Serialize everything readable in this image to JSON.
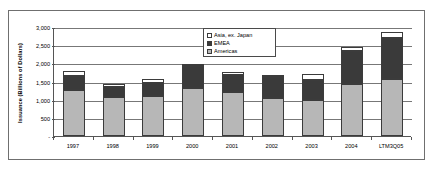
{
  "chart_data": {
    "type": "bar",
    "title": "",
    "subtitle": "",
    "xlabel": "",
    "ylabel": "Issuance (Billions of Dollars)",
    "stacked": true,
    "grid": true,
    "legend_position": "top-center",
    "ylim": [
      0,
      3000
    ],
    "ytick_values": [
      0,
      500,
      1000,
      1500,
      2000,
      2500,
      3000
    ],
    "ytick_labels": [
      "-",
      "500",
      "1,000",
      "1,500",
      "2,000",
      "2,500",
      "3,000"
    ],
    "categories": [
      "1997",
      "1998",
      "1999",
      "2000",
      "2001",
      "2002",
      "2003",
      "2004",
      "LTM3Q05"
    ],
    "series": [
      {
        "name": "Americas",
        "color": "#b7b7b7",
        "values": [
          1280,
          1070,
          1115,
          1310,
          1200,
          1035,
          1000,
          1440,
          1560
        ]
      },
      {
        "name": "EMEA",
        "color": "#3a3a3a",
        "values": [
          360,
          290,
          340,
          610,
          490,
          600,
          555,
          900,
          1150
        ]
      },
      {
        "name": "Asia, ex. Japan",
        "color": "#ffffff",
        "values": [
          150,
          60,
          105,
          50,
          60,
          45,
          155,
          110,
          150
        ]
      }
    ],
    "totals": [
      1790,
      1420,
      1560,
      1970,
      1750,
      1680,
      1710,
      2450,
      2860
    ]
  },
  "legend": {
    "entries": [
      {
        "label": "Asia, ex. Japan",
        "swatch": "#ffffff"
      },
      {
        "label": "EMEA",
        "swatch": "#3a3a3a"
      },
      {
        "label": "Americas",
        "swatch": "#b7b7b7"
      }
    ]
  }
}
